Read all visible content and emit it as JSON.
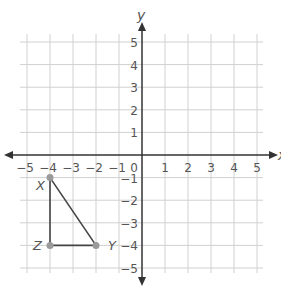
{
  "axes": {
    "x_label": "x",
    "y_label": "y",
    "x_ticks": [
      "-5",
      "-4",
      "-3",
      "-2",
      "-1",
      "1",
      "2",
      "3",
      "4",
      "5"
    ],
    "y_ticks_pos": [
      "5",
      "4",
      "3",
      "2",
      "1"
    ],
    "y_ticks_neg": [
      "-1",
      "-2",
      "-3",
      "-4",
      "-5"
    ],
    "origin_label": "0",
    "range": {
      "x": [
        -5,
        5
      ],
      "y": [
        -5,
        5
      ]
    }
  },
  "triangle": {
    "points": [
      {
        "label": "X",
        "x": -4,
        "y": -1
      },
      {
        "label": "Y",
        "x": -2,
        "y": -4
      },
      {
        "label": "Z",
        "x": -4,
        "y": -4
      }
    ]
  },
  "colors": {
    "grid": "#d0d0d0",
    "axis": "#333333",
    "shape": "#444444",
    "point": "#9a9a9a"
  }
}
